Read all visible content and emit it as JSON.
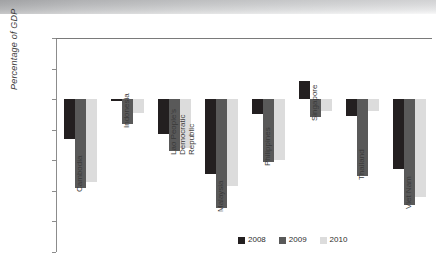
{
  "figure": {
    "ylabel": "Percentage of GDP"
  },
  "chart_data": {
    "type": "bar",
    "title": "",
    "subtitle": "",
    "xlabel": "",
    "ylabel": "Percentage of GDP",
    "ylim": [
      -10,
      4
    ],
    "yticks": [
      4,
      2,
      0,
      -2,
      -4,
      -6,
      -8,
      -10
    ],
    "ytick_labels": [
      "4",
      "2",
      "0",
      "-2",
      "-4",
      "-6",
      "-8",
      "-10"
    ],
    "grid": false,
    "orientation": "vertical",
    "legend_position": "bottom-center",
    "categories": [
      "Cambodia",
      "Indonesia",
      "Lao People's Democratic Republic",
      "Malaysia",
      "Philippines",
      "Singapore",
      "Thailand",
      "Viet Nam"
    ],
    "category_label_lines": [
      [
        "Cambodia"
      ],
      [
        "Indonesia"
      ],
      [
        "Lao People's",
        "Democratic",
        "Republic"
      ],
      [
        "Malaysia"
      ],
      [
        "Philippines"
      ],
      [
        "Singapore"
      ],
      [
        "Thailand"
      ],
      [
        "Viet Nam"
      ]
    ],
    "series": [
      {
        "name": "2008",
        "color": "#231f20",
        "values": [
          -2.6,
          -0.1,
          -2.3,
          -4.9,
          -1.0,
          1.2,
          -1.1,
          -4.6
        ]
      },
      {
        "name": "2009",
        "color": "#595959",
        "values": [
          -5.8,
          -1.6,
          -3.4,
          -7.1,
          -4.1,
          -1.2,
          -5.0,
          -6.9
        ]
      },
      {
        "name": "2010",
        "color": "#dcdcdc",
        "values": [
          -5.4,
          -0.9,
          -3.2,
          -5.7,
          -4.0,
          -0.8,
          -0.8,
          -6.4
        ]
      }
    ],
    "legend": [
      {
        "label": "2008",
        "color": "#231f20"
      },
      {
        "label": "2009",
        "color": "#595959"
      },
      {
        "label": "2010",
        "color": "#dcdcdc"
      }
    ]
  }
}
